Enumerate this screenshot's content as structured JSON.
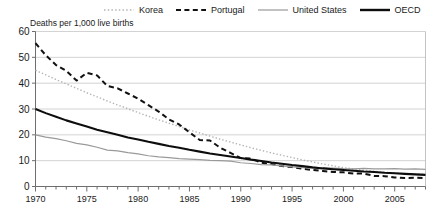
{
  "chart_data": {
    "type": "line",
    "title": "",
    "ylabel": "Deaths per 1,000 live births",
    "xlabel": "",
    "ylim": [
      0,
      60
    ],
    "xlim": [
      1970,
      2008
    ],
    "yticks": [
      0,
      10,
      20,
      30,
      40,
      50,
      60
    ],
    "xticks": [
      1970,
      1975,
      1980,
      1985,
      1990,
      1995,
      2000,
      2005
    ],
    "xtick_labels": [
      "1970",
      "1975",
      "1980",
      "1985",
      "1990",
      "1995",
      "2000",
      "2005"
    ],
    "ytick_labels": [
      "0",
      "10",
      "20",
      "30",
      "40",
      "50",
      "60"
    ],
    "grid": "horizontal",
    "legend_position": "top",
    "minor_tick_interval": 1,
    "x": [
      1970,
      1971,
      1972,
      1973,
      1974,
      1975,
      1976,
      1977,
      1978,
      1979,
      1980,
      1981,
      1982,
      1983,
      1984,
      1985,
      1986,
      1987,
      1988,
      1989,
      1990,
      1991,
      1992,
      1993,
      1994,
      1995,
      1996,
      1997,
      1998,
      1999,
      2000,
      2001,
      2002,
      2003,
      2004,
      2005,
      2006,
      2007,
      2008
    ],
    "series": [
      {
        "name": "Korea",
        "style": "dotted",
        "color": "#b5b5b5",
        "width": 1.4,
        "values": [
          45.0,
          43.2,
          41.4,
          39.7,
          38.0,
          36.3,
          34.7,
          33.1,
          31.6,
          30.1,
          28.6,
          27.2,
          25.8,
          24.5,
          23.2,
          21.9,
          20.7,
          19.5,
          18.3,
          17.2,
          16.1,
          15.0,
          14.0,
          13.0,
          12.1,
          11.2,
          10.3,
          9.5,
          8.7,
          8.0,
          7.3,
          6.8,
          6.3,
          5.9,
          5.5,
          5.3,
          5.0,
          4.8,
          4.7
        ]
      },
      {
        "name": "Portugal",
        "style": "dashed",
        "color": "#111111",
        "width": 2.0,
        "values": [
          55.5,
          50.8,
          47.0,
          44.8,
          41.0,
          44.0,
          43.0,
          38.9,
          38.0,
          36.0,
          34.0,
          31.5,
          29.0,
          26.0,
          24.0,
          21.0,
          18.0,
          17.8,
          15.0,
          13.0,
          11.0,
          10.8,
          9.2,
          8.7,
          7.9,
          7.5,
          6.9,
          6.4,
          6.0,
          5.6,
          5.5,
          5.0,
          5.0,
          4.1,
          4.0,
          3.5,
          3.3,
          3.4,
          3.3
        ]
      },
      {
        "name": "United States",
        "style": "solid",
        "color": "#9a9a9a",
        "width": 1.2,
        "values": [
          20.0,
          19.1,
          18.5,
          17.7,
          16.7,
          16.1,
          15.2,
          14.1,
          13.8,
          13.1,
          12.6,
          11.9,
          11.5,
          11.2,
          10.8,
          10.6,
          10.4,
          10.1,
          10.0,
          9.8,
          9.2,
          8.9,
          8.5,
          8.4,
          8.0,
          7.6,
          7.3,
          7.2,
          7.2,
          7.1,
          6.9,
          6.8,
          7.0,
          6.8,
          6.8,
          6.9,
          6.7,
          6.8,
          6.6
        ]
      },
      {
        "name": "OECD",
        "style": "solid",
        "color": "#0d0d0d",
        "width": 2.1,
        "values": [
          30.0,
          28.4,
          27.0,
          25.6,
          24.4,
          23.2,
          22.0,
          21.0,
          20.0,
          19.0,
          18.2,
          17.3,
          16.5,
          15.7,
          15.0,
          14.2,
          13.5,
          12.8,
          12.2,
          11.6,
          11.0,
          10.4,
          9.9,
          9.3,
          8.8,
          8.3,
          7.9,
          7.4,
          7.0,
          6.7,
          6.4,
          6.1,
          5.8,
          5.6,
          5.3,
          5.1,
          4.9,
          4.7,
          4.5
        ]
      }
    ]
  },
  "legend": {
    "items": [
      {
        "label": "Korea"
      },
      {
        "label": "Portugal"
      },
      {
        "label": "United States"
      },
      {
        "label": "OECD"
      }
    ]
  }
}
